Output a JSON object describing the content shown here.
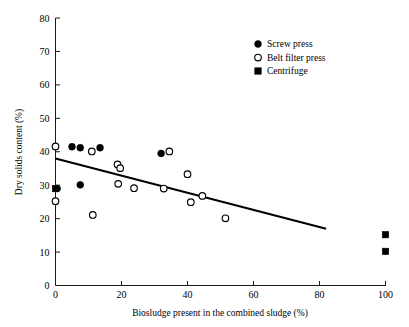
{
  "chart_data": {
    "type": "scatter",
    "title": "",
    "xlabel": "Biosludge present in the combined sludge (%)",
    "ylabel": "Dry solids content (%)",
    "xlim": [
      0,
      100
    ],
    "ylim": [
      0,
      80
    ],
    "xticks": [
      0,
      20,
      40,
      60,
      80,
      100
    ],
    "yticks": [
      0,
      10,
      20,
      30,
      40,
      50,
      60,
      70,
      80
    ],
    "xtick_labels": [
      "0",
      "20",
      "40",
      "60",
      "80",
      "100"
    ],
    "ytick_labels": [
      "0",
      "10",
      "20",
      "30",
      "40",
      "50",
      "60",
      "70",
      "80"
    ],
    "grid": false,
    "legend_position": "top-right",
    "series": [
      {
        "name": "Screw press",
        "marker": "filled-circle",
        "color": "#000000",
        "points": [
          {
            "x": 0.5,
            "y": 29.0
          },
          {
            "x": 5.0,
            "y": 41.5
          },
          {
            "x": 7.5,
            "y": 41.2
          },
          {
            "x": 7.5,
            "y": 30.1
          },
          {
            "x": 13.5,
            "y": 41.2
          },
          {
            "x": 32.0,
            "y": 39.5
          }
        ]
      },
      {
        "name": "Belt filter press",
        "marker": "open-circle",
        "color": "#000000",
        "points": [
          {
            "x": 0.0,
            "y": 41.6
          },
          {
            "x": 0.0,
            "y": 25.2
          },
          {
            "x": 11.0,
            "y": 40.1
          },
          {
            "x": 11.3,
            "y": 21.1
          },
          {
            "x": 18.8,
            "y": 36.2
          },
          {
            "x": 19.6,
            "y": 35.1
          },
          {
            "x": 19.0,
            "y": 30.4
          },
          {
            "x": 23.8,
            "y": 29.1
          },
          {
            "x": 32.8,
            "y": 29.0
          },
          {
            "x": 34.5,
            "y": 40.1
          },
          {
            "x": 40.0,
            "y": 33.3
          },
          {
            "x": 41.0,
            "y": 24.9
          },
          {
            "x": 44.5,
            "y": 26.8
          },
          {
            "x": 51.5,
            "y": 20.1
          }
        ]
      },
      {
        "name": "Centrifuge",
        "marker": "filled-square",
        "color": "#000000",
        "points": [
          {
            "x": 0.0,
            "y": 29.0
          },
          {
            "x": 100.0,
            "y": 15.2
          },
          {
            "x": 100.0,
            "y": 10.2
          }
        ]
      }
    ],
    "trend_line": {
      "name": "linear fit",
      "x_start": 0.0,
      "y_start": 38.0,
      "x_end": 82.0,
      "y_end": 17.0
    },
    "legend": [
      {
        "label": "Screw press",
        "marker": "filled-circle"
      },
      {
        "label": "Belt filter press",
        "marker": "open-circle"
      },
      {
        "label": "Centrifuge",
        "marker": "filled-square"
      }
    ]
  }
}
